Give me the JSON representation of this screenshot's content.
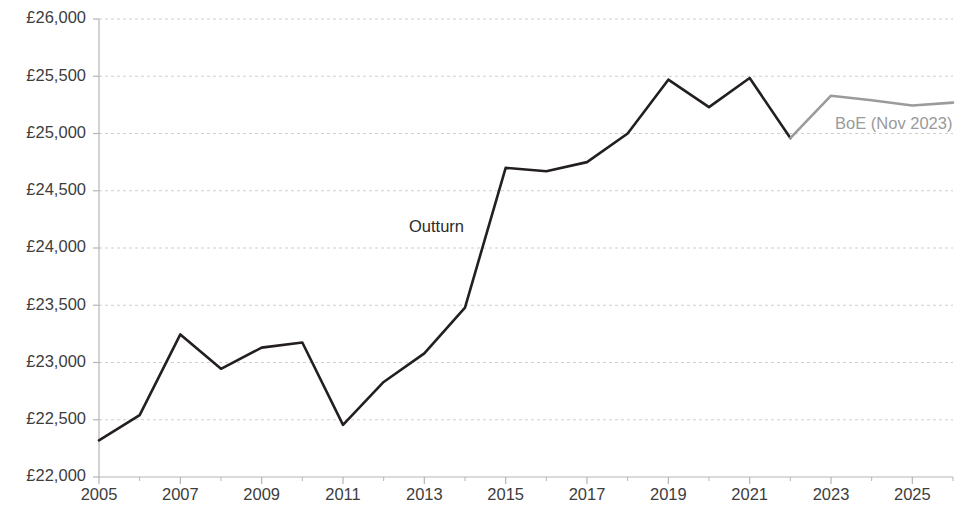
{
  "chart_data": {
    "type": "line",
    "title": "",
    "subtitle": "",
    "xlabel": "",
    "ylabel": "",
    "grid": true,
    "legend_position": "inline-annotation",
    "x": [
      2005,
      2006,
      2007,
      2008,
      2009,
      2010,
      2011,
      2012,
      2013,
      2014,
      2015,
      2016,
      2017,
      2018,
      2019,
      2020,
      2021,
      2022,
      2023,
      2024,
      2025,
      2026
    ],
    "xlim": [
      2005,
      2026
    ],
    "ylim": [
      22000,
      26000
    ],
    "y_tick_values": [
      22000,
      22500,
      23000,
      23500,
      24000,
      24500,
      25000,
      25500,
      26000
    ],
    "y_tick_labels": [
      "£22,000",
      "£22,500",
      "£23,000",
      "£23,500",
      "£24,000",
      "£24,500",
      "£25,000",
      "£25,500",
      "£26,000"
    ],
    "x_tick_values": [
      2005,
      2007,
      2009,
      2011,
      2013,
      2015,
      2017,
      2019,
      2021,
      2023,
      2025
    ],
    "x_tick_labels": [
      "2005",
      "2007",
      "2009",
      "2011",
      "2013",
      "2015",
      "2017",
      "2019",
      "2021",
      "2023",
      "2025"
    ],
    "series": [
      {
        "name": "Outturn",
        "color": "#231f20",
        "x": [
          2005,
          2006,
          2007,
          2008,
          2009,
          2010,
          2011,
          2012,
          2013,
          2014,
          2015,
          2016,
          2017,
          2018,
          2019,
          2020,
          2021,
          2022
        ],
        "values": [
          22320,
          22540,
          23245,
          22945,
          23130,
          23175,
          22455,
          22830,
          23080,
          23480,
          24700,
          24670,
          24750,
          25000,
          25470,
          25230,
          25485,
          24960
        ]
      },
      {
        "name": "BoE (Nov 2023)",
        "color": "#9b9b9b",
        "x": [
          2022,
          2023,
          2024,
          2025,
          2026
        ],
        "values": [
          24960,
          25330,
          25290,
          25245,
          25270
        ]
      }
    ],
    "annotations": [
      {
        "text": "Outturn",
        "x": 2013.3,
        "y": 24180,
        "color": "#2b2b2b",
        "align": "middle"
      },
      {
        "text": "BoE (Nov 2023)",
        "x": 2023.1,
        "y": 25075,
        "color": "#9a9a9a",
        "align": "start"
      }
    ]
  }
}
